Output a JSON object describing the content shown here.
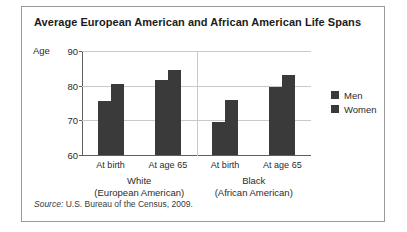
{
  "figure": {
    "title": "Average European American and African American Life Spans",
    "axis_label": "Age",
    "source_prefix": "Source:",
    "source_text": " U.S. Bureau of the Census, 2009."
  },
  "legend": {
    "position": "right",
    "items": [
      {
        "label": "Men",
        "color": "#3a3a3a"
      },
      {
        "label": "Women",
        "color": "#3a3a3a"
      }
    ]
  },
  "groups": [
    {
      "name": "White",
      "subtitle": "(European American)"
    },
    {
      "name": "Black",
      "subtitle": "(African American)"
    }
  ],
  "chart_data": {
    "type": "bar",
    "title": "Average European American and African American Life Spans",
    "xlabel": "",
    "ylabel": "Age",
    "ylim": [
      60,
      90
    ],
    "yticks": [
      60,
      70,
      80,
      90
    ],
    "grid": true,
    "legend_position": "right",
    "group_labels": [
      "White (European American)",
      "Black (African American)"
    ],
    "categories": [
      "White / At birth",
      "White / At age 65",
      "Black / At birth",
      "Black / At age 65"
    ],
    "category_tick_labels": [
      "At birth",
      "At age 65",
      "At birth",
      "At age 65"
    ],
    "series": [
      {
        "name": "Men",
        "color": "#3a3a3a",
        "values": [
          75.5,
          81.5,
          69.5,
          79.7
        ]
      },
      {
        "name": "Women",
        "color": "#3a3a3a",
        "values": [
          80.5,
          84.5,
          76.0,
          83.0
        ]
      }
    ],
    "source": "Source: U.S. Bureau of the Census, 2009."
  }
}
